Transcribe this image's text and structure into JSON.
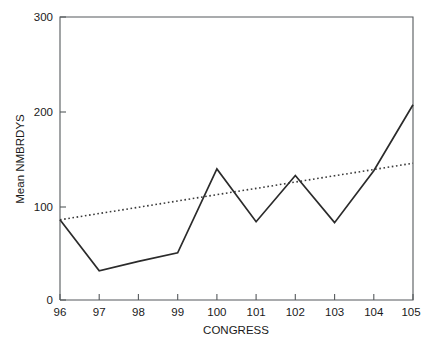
{
  "chart_data": {
    "type": "line",
    "title": "",
    "subtitle": "",
    "xlabel": "CONGRESS",
    "ylabel": "Mean NMBRDYS",
    "x": [
      96,
      97,
      98,
      99,
      100,
      101,
      102,
      103,
      104,
      105
    ],
    "xlim": [
      96,
      105
    ],
    "ylim": [
      0,
      300
    ],
    "xticks": [
      96,
      97,
      98,
      99,
      100,
      101,
      102,
      103,
      104,
      105
    ],
    "xtick_labels": [
      "96",
      "97",
      "98",
      "99",
      "100",
      "101",
      "102",
      "103",
      "104",
      "105"
    ],
    "yticks": [
      0,
      100,
      200,
      300
    ],
    "ytick_labels": [
      "0",
      "100",
      "200",
      "300"
    ],
    "grid": false,
    "legend": "none",
    "series": [
      {
        "name": "Mean NMBRDYS",
        "style": "solid",
        "color": "#2b2b2b",
        "values": [
          85,
          31,
          41,
          50,
          139,
          83,
          132,
          82,
          137,
          207
        ]
      },
      {
        "name": "Linear trend",
        "style": "dotted",
        "color": "#3a3a3a",
        "values": [
          85,
          91.7,
          98.3,
          105,
          111.7,
          118.3,
          125,
          131.7,
          138.3,
          145
        ]
      }
    ],
    "annotations": []
  },
  "axes": {
    "y_axis_title": "Mean NMBRDYS",
    "x_axis_title": "CONGRESS",
    "y_tick_0": "0",
    "y_tick_100": "100",
    "y_tick_200": "200",
    "y_tick_300": "300",
    "x_tick_96": "96",
    "x_tick_97": "97",
    "x_tick_98": "98",
    "x_tick_99": "99",
    "x_tick_100": "100",
    "x_tick_101": "101",
    "x_tick_102": "102",
    "x_tick_103": "103",
    "x_tick_104": "104",
    "x_tick_105": "105"
  },
  "colors": {
    "background": "#ffffff",
    "frame": "#55595c",
    "series": "#2b2b2b",
    "trend": "#3a3a3a",
    "text": "#1a1a1a"
  }
}
